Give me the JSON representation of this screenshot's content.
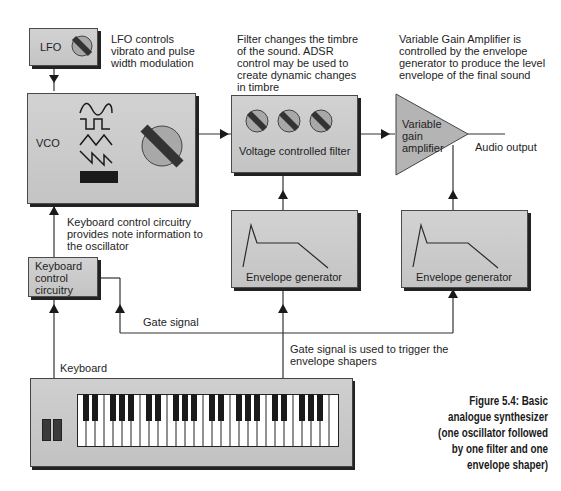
{
  "figure": {
    "caption_lines": [
      "Figure 5.4: Basic",
      "analogue synthesizer",
      "(one oscillator followed",
      "by one filter and one",
      "envelope shaper)"
    ]
  },
  "blocks": {
    "lfo": {
      "label": "LFO",
      "control": "knob"
    },
    "vco": {
      "label": "VCO",
      "waveforms": [
        "sine",
        "square",
        "triangle",
        "sawtooth",
        "noise"
      ],
      "control": "knob"
    },
    "vcf": {
      "label": "Voltage controlled filter",
      "knob_count": 3
    },
    "vga": {
      "label_lines": [
        "Variable",
        "gain",
        "amplifier"
      ]
    },
    "env_filter": {
      "label": "Envelope generator",
      "shape": "ADSR"
    },
    "env_amp": {
      "label": "Envelope generator",
      "shape": "ADSR"
    },
    "keyboard_control": {
      "label_lines": [
        "Keyboard",
        "control",
        "circuitry"
      ]
    },
    "keyboard": {
      "label": "Keyboard",
      "octaves": 4,
      "white_keys": 29
    }
  },
  "annotations": {
    "lfo_note": [
      "LFO controls",
      "vibrato and pulse",
      "width modulation"
    ],
    "filter_note": [
      "Filter changes the timbre",
      "of the sound. ADSR",
      "control may be used to",
      "create dynamic changes",
      "in timbre"
    ],
    "vga_note": [
      "Variable Gain Amplifier is",
      "controlled by the envelope",
      "generator to produce the level",
      "envelope of the final sound"
    ],
    "keyboard_control_note": [
      "Keyboard control circuitry",
      "provides note information to",
      "the oscillator"
    ],
    "gate_signal": "Gate signal",
    "gate_note": [
      "Gate signal is used to trigger the",
      "envelope shapers"
    ],
    "audio_output": "Audio output"
  },
  "colors": {
    "box_fill": "#c8c8c8",
    "box_border": "#4a4a4a",
    "shadow": "#222222",
    "line": "#333333",
    "knob_fill": "#a8a8a8",
    "knob_bar": "#3a3a3a",
    "vga_fill": "#b4b4b4"
  }
}
